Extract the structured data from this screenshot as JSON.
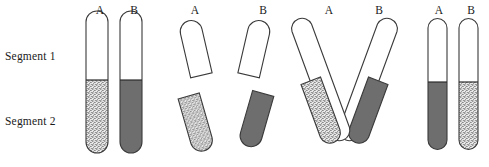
{
  "figure": {
    "row_labels": [
      {
        "id": "segment-1",
        "text": "Segment 1"
      },
      {
        "id": "segment-2",
        "text": "Segment 2"
      }
    ],
    "colors": {
      "outline": "#3a3a3a",
      "white_fill": "#ffffff",
      "dark_fill": "#6e6e6e",
      "stipple_base": "#e9e9e9",
      "stipple_dot": "#5a5a5a",
      "text": "#1a1a1a",
      "background": "#ffffff"
    },
    "groups": [
      {
        "id": "group-1-paired",
        "name": "paired-homologs",
        "chromatids": [
          {
            "label": "A",
            "label_x": 93,
            "label_y": 4,
            "segment1_fill": "white",
            "segment2_fill": "stipple"
          },
          {
            "label": "B",
            "label_x": 127,
            "label_y": 4,
            "segment1_fill": "white",
            "segment2_fill": "dark"
          }
        ]
      },
      {
        "id": "group-2-separated",
        "name": "separated-segments",
        "chromatids": [
          {
            "label": "A",
            "label_x": 188,
            "label_y": 4,
            "segment1_fill": "white",
            "segment2_fill": "stipple"
          },
          {
            "label": "B",
            "label_x": 256,
            "label_y": 4,
            "segment1_fill": "white",
            "segment2_fill": "dark"
          }
        ]
      },
      {
        "id": "group-3-crossed",
        "name": "crossed-over",
        "chromatids": [
          {
            "label": "A",
            "label_x": 322,
            "label_y": 4,
            "segment1_fill": "white",
            "segment2_fill": "stipple"
          },
          {
            "label": "B",
            "label_x": 372,
            "label_y": 4,
            "segment1_fill": "white",
            "segment2_fill": "dark"
          }
        ]
      },
      {
        "id": "group-4-recombinant",
        "name": "recombinant-products",
        "chromatids": [
          {
            "label": "A",
            "label_x": 432,
            "label_y": 4,
            "segment1_fill": "white",
            "segment2_fill": "dark"
          },
          {
            "label": "B",
            "label_x": 464,
            "label_y": 4,
            "segment1_fill": "white",
            "segment2_fill": "stipple"
          }
        ]
      }
    ]
  }
}
